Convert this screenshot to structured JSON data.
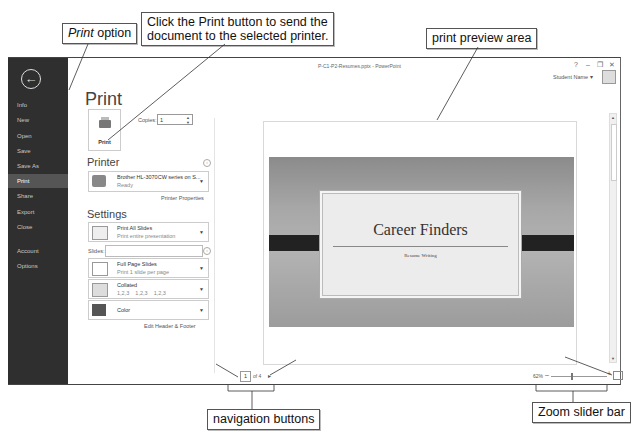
{
  "callouts": {
    "print_option": {
      "italic": "Print",
      "rest": " option"
    },
    "print_button_line1": "Click the Print button to send the",
    "print_button_line2": "document to the selected printer.",
    "preview_area": "print preview area",
    "prev_page": "Previous Page button",
    "next_page": "Next Page button",
    "zoom_to_page": "Zoom to Page button",
    "navigation": "navigation buttons",
    "zoom_slider": "Zoom slider bar"
  },
  "window": {
    "title": "P-C1-P2-Resumes.pptx - PowerPoint",
    "controls": {
      "help": "?",
      "minimize": "–",
      "restore": "❐",
      "close": "✕"
    },
    "user_name": "Student Name ▾"
  },
  "backstage": {
    "back_icon": "←",
    "items": [
      {
        "label": "Info"
      },
      {
        "label": "New"
      },
      {
        "label": "Open"
      },
      {
        "label": "Save"
      },
      {
        "label": "Save As"
      },
      {
        "label": "Print",
        "active": true
      },
      {
        "label": "Share"
      },
      {
        "label": "Export"
      },
      {
        "label": "Close"
      },
      {
        "label": "Account"
      },
      {
        "label": "Options"
      }
    ]
  },
  "print_panel": {
    "heading": "Print",
    "print_button": "Print",
    "copies_label": "Copies:",
    "copies_value": "1",
    "printer_heading": "Printer",
    "printer_name": "Brother HL-3070CW series on S...",
    "printer_status": "Ready",
    "printer_properties": "Printer Properties",
    "settings_heading": "Settings",
    "settings": [
      {
        "title": "Print All Slides",
        "subtitle": "Print entire presentation"
      },
      {
        "title": "Full Page Slides",
        "subtitle": "Print 1 slide per page"
      },
      {
        "title": "Collated",
        "subtitle": "1,2,3    1,2,3    1,2,3"
      },
      {
        "title": "Color",
        "subtitle": ""
      }
    ],
    "slides_label": "Slides:",
    "slides_value": "",
    "edit_header_footer": "Edit Header & Footer"
  },
  "preview": {
    "slide_title": "Career Finders",
    "slide_subtitle": "Resume Writing",
    "current_page": "1",
    "of_pages": "of 4",
    "next_icon": "▸",
    "zoom_percent": "62%",
    "zoom_minus": "–",
    "zoom_plus": "+"
  }
}
